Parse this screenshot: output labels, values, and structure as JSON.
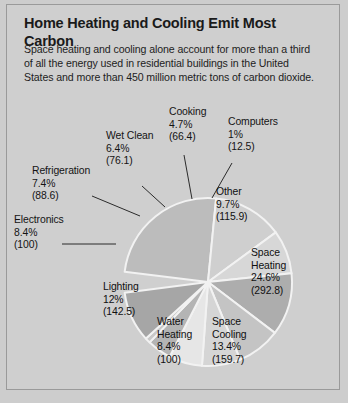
{
  "figure": {
    "title": "Home Heating and Cooling Emit Most Carbon",
    "subtitle": "Space heating and cooling alone account for more than a third of all the energy used in residential buildings in the United States and more than 450 million metric tons of carbon dioxide."
  },
  "colors": {
    "background": "#cfcfcf",
    "border": "#9a9a9a",
    "slice_separator": "#f2f2f2",
    "text": "#141414"
  },
  "chart_data": {
    "type": "pie",
    "title": "Home Heating and Cooling Emit Most Carbon",
    "subtitle": "Space heating and cooling alone account for more than a third of all the energy used in residential buildings in the United States and more than 450 million metric tons of carbon dioxide.",
    "value_unit": "million metric tons of carbon dioxide",
    "legend": "none",
    "grid": false,
    "categories": [
      "Space Heating",
      "Space Cooling",
      "Water Heating",
      "Lighting",
      "Electronics",
      "Refrigeration",
      "Wet Clean",
      "Cooking",
      "Computers",
      "Other"
    ],
    "percentages": [
      24.6,
      13.4,
      8.4,
      12.0,
      8.4,
      7.4,
      6.4,
      4.7,
      1.0,
      9.7
    ],
    "values": [
      292.8,
      159.7,
      100,
      142.5,
      100,
      88.6,
      76.1,
      66.4,
      12.5,
      115.9
    ],
    "slices": [
      {
        "name": "Space Heating",
        "percent_label": "24.6%",
        "value_label": "(292.8)",
        "percent": 24.6,
        "value": 292.8,
        "color": "#bcbcbc",
        "label_placement": "inside"
      },
      {
        "name": "Space Cooling",
        "percent_label": "13.4%",
        "value_label": "(159.7)",
        "percent": 13.4,
        "value": 159.7,
        "color": "#cfcfcf",
        "label_placement": "inside"
      },
      {
        "name": "Water Heating",
        "percent_label": "8.4%",
        "value_label": "(100)",
        "percent": 8.4,
        "value": 100,
        "color": "#d7d7d7",
        "label_placement": "inside"
      },
      {
        "name": "Lighting",
        "percent_label": "12%",
        "value_label": "(142.5)",
        "percent": 12.0,
        "value": 142.5,
        "color": "#adadad",
        "label_placement": "inside"
      },
      {
        "name": "Electronics",
        "percent_label": "8.4%",
        "value_label": "(100)",
        "percent": 8.4,
        "value": 100,
        "color": "#c4c4c4",
        "label_placement": "outside"
      },
      {
        "name": "Refrigeration",
        "percent_label": "7.4%",
        "value_label": "(88.6)",
        "percent": 7.4,
        "value": 88.6,
        "color": "#d5d5d5",
        "label_placement": "outside"
      },
      {
        "name": "Wet Clean",
        "percent_label": "6.4%",
        "value_label": "(76.1)",
        "percent": 6.4,
        "value": 76.1,
        "color": "#e6e6e6",
        "label_placement": "outside"
      },
      {
        "name": "Cooking",
        "percent_label": "4.7%",
        "value_label": "(66.4)",
        "percent": 4.7,
        "value": 66.4,
        "color": "#b4b4b4",
        "label_placement": "outside"
      },
      {
        "name": "Computers",
        "percent_label": "1%",
        "value_label": "(12.5)",
        "percent": 1.0,
        "value": 12.5,
        "color": "#c8c8c8",
        "label_placement": "outside"
      },
      {
        "name": "Other",
        "percent_label": "9.7%",
        "value_label": "(115.9)",
        "percent": 9.7,
        "value": 115.9,
        "color": "#a6a6a6",
        "label_placement": "inside"
      }
    ]
  }
}
